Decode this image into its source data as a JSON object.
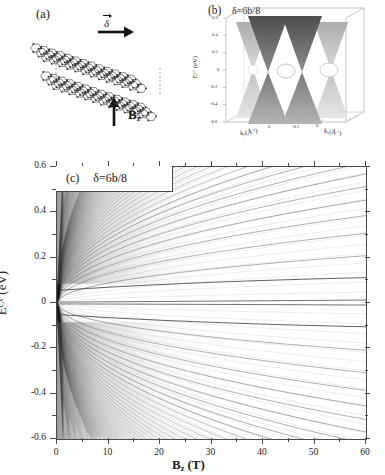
{
  "figure": {
    "panel_a": {
      "tag": "(a)",
      "delta_arrow_label": "δ",
      "field_label_main": "B",
      "field_label_sub": "z",
      "lattice": {
        "description": "bilayer-graphene-sheets",
        "sheets": 2
      }
    },
    "panel_b": {
      "tag": "(b)",
      "title": "δ=6b/8",
      "ylabel_main": "E",
      "ylabel_sup": "c,v",
      "ylabel_unit": " (eV)",
      "y_ticks": [
        "0.6",
        "0.4",
        "0.2",
        "0",
        "-0.2",
        "-0.4",
        "-0.6"
      ],
      "x_axis_label_left": "k",
      "x_axis_label_left_sub": "y",
      "x_axis_label_left_unit": "(Å",
      "x_axis_label_left_sup": "-1",
      "x_axis_label_left_close": ")",
      "x_axis_label_right": "k",
      "x_axis_label_right_sub": "x",
      "x_axis_label_right_unit": "(Å",
      "x_axis_label_right_sup": "-1",
      "x_axis_label_right_close": ")",
      "ky_ticks": [
        "-0.1",
        "0",
        "0.1"
      ],
      "kx_ticks": [
        "-0.1",
        "0",
        "0.1"
      ]
    },
    "panel_c": {
      "tag": "(c)",
      "title": "δ=6b/8",
      "ylabel_main": "E",
      "ylabel_sup": "c,v",
      "ylabel_unit": " (eV)",
      "xlabel_main": "B",
      "xlabel_sub": "z",
      "xlabel_unit": " (T)"
    }
  },
  "chart_data": {
    "type": "line",
    "title": "δ=6b/8",
    "subtitle": "Landau level fan diagram of shifted bilayer graphene",
    "xlabel": "B_z (T)",
    "ylabel": "E^{c,v} (eV)",
    "xlim": [
      0,
      60
    ],
    "ylim": [
      -0.6,
      0.6
    ],
    "xticks": [
      0,
      10,
      20,
      30,
      40,
      50,
      60
    ],
    "xticks_minor": [
      5,
      15,
      25,
      35,
      45,
      55
    ],
    "yticks": [
      0.6,
      0.4,
      0.2,
      0,
      -0.2,
      -0.4,
      -0.6
    ],
    "yticks_minor": [
      0.5,
      0.3,
      0.1,
      -0.1,
      -0.3,
      -0.5
    ],
    "grid": false,
    "legend": "none",
    "line_color": "#2b2b2b",
    "series_note": "Landau levels E_n ~ +/- sqrt(n*B) fanning from E=0 at B=0; conduction (upper) and valence (lower) families plus two nearly flat zero-energy levels.",
    "series": [
      {
        "name": "LL n=0 (upper)",
        "kind": "flat",
        "value_at_60T": 0.012
      },
      {
        "name": "LL n=0 (lower)",
        "kind": "flat",
        "value_at_60T": -0.008
      },
      {
        "name": "conduction-fan",
        "kind": "sqrt-family",
        "count": 42,
        "max_at_60T": 0.56
      },
      {
        "name": "valence-fan",
        "kind": "sqrt-family",
        "count": 42,
        "max_at_60T": -0.56
      }
    ]
  }
}
